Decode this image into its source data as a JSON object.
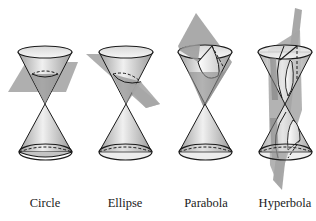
{
  "figure": {
    "panels": [
      {
        "id": "circle",
        "label": "Circle",
        "center_x": 45,
        "plane": "horizontal"
      },
      {
        "id": "ellipse",
        "label": "Ellipse",
        "center_x": 125,
        "plane": "tilted"
      },
      {
        "id": "parabola",
        "label": "Parabola",
        "center_x": 205,
        "plane": "parallel-to-side"
      },
      {
        "id": "hyperbola",
        "label": "Hyperbola",
        "center_x": 285,
        "plane": "vertical"
      }
    ]
  },
  "colors": {
    "plane_fill": "#9a9a9a",
    "cone_light": "#f2f2f2",
    "cone_dark": "#a8a8a8",
    "outline": "#1a1a1a",
    "section_fill": "#6e6e6e"
  }
}
